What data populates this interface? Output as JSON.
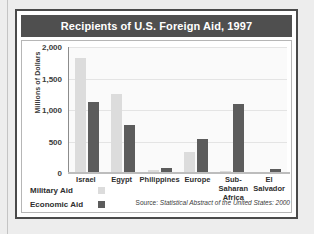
{
  "figure": {
    "title": "Recipients of U.S. Foreign Aid, 1997",
    "source_prefix": "Source: ",
    "source_title": "Statistical Abstract of the United States: 2000",
    "title_bar_color": "#4f4f4f",
    "border_color": "#4a4a4a"
  },
  "legend": {
    "position": "bottom-left",
    "items": [
      {
        "label": "Military Aid",
        "color": "#dcdcdc"
      },
      {
        "label": "Economic Aid",
        "color": "#5c5c5c"
      }
    ]
  },
  "chart_data": {
    "type": "bar",
    "title": "Recipients of U.S. Foreign Aid, 1997",
    "xlabel": "",
    "ylabel": "Millions of Dollars",
    "categories": [
      "Israel",
      "Egypt",
      "Philippines",
      "Europe",
      "Sub-Saharan\nAfrica",
      "El\nSalvador"
    ],
    "series": [
      {
        "name": "Military Aid",
        "color": "#dcdcdc",
        "values": [
          1830,
          1250,
          40,
          340,
          25,
          20
        ]
      },
      {
        "name": "Economic Aid",
        "color": "#5c5c5c",
        "values": [
          1120,
          770,
          85,
          540,
          1100,
          60
        ]
      }
    ],
    "ylim": [
      0,
      2000
    ],
    "yticks": [
      0,
      500,
      1000,
      1500,
      2000
    ],
    "ytick_labels": [
      "0",
      "500",
      "1,000",
      "1,500",
      "2,000"
    ],
    "grid": true,
    "legend_position": "bottom-left"
  }
}
